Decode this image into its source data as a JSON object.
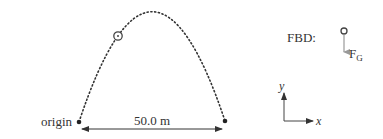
{
  "diagram": {
    "type": "projectile-motion",
    "labels": {
      "origin": "origin",
      "range": "50.0 m",
      "fbd": "FBD:",
      "force_main": "F",
      "force_sub": "G",
      "axis_x": "x",
      "axis_y": "y"
    },
    "colors": {
      "trajectory": "#333333",
      "text": "#333333",
      "force_arrow": "#888888",
      "axes": "#444444"
    },
    "geometry": {
      "origin_point": [
        79,
        122
      ],
      "landing_point": [
        225,
        121
      ],
      "apex": [
        152,
        12
      ],
      "ball": [
        118,
        36
      ],
      "fbd_ball": [
        344,
        31
      ],
      "axes_corner": [
        284,
        121
      ]
    }
  }
}
